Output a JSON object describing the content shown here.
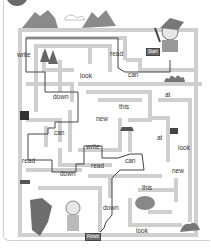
{
  "puzzle": {
    "start_label": "Start",
    "finish_label": "Finish",
    "words": [
      {
        "text": "write",
        "x": 17,
        "y": 52
      },
      {
        "text": "read",
        "x": 110,
        "y": 51
      },
      {
        "text": "look",
        "x": 80,
        "y": 73
      },
      {
        "text": "can",
        "x": 128,
        "y": 72
      },
      {
        "text": "down",
        "x": 53,
        "y": 94
      },
      {
        "text": "at",
        "x": 165,
        "y": 92
      },
      {
        "text": "this",
        "x": 119,
        "y": 104
      },
      {
        "text": "new",
        "x": 96,
        "y": 116
      },
      {
        "text": "at",
        "x": 157,
        "y": 135
      },
      {
        "text": "look",
        "x": 178,
        "y": 145
      },
      {
        "text": "can",
        "x": 54,
        "y": 130
      },
      {
        "text": "write",
        "x": 86,
        "y": 144
      },
      {
        "text": "read",
        "x": 22,
        "y": 158
      },
      {
        "text": "read",
        "x": 91,
        "y": 163
      },
      {
        "text": "can",
        "x": 125,
        "y": 158
      },
      {
        "text": "down",
        "x": 60,
        "y": 171
      },
      {
        "text": "new",
        "x": 172,
        "y": 168
      },
      {
        "text": "this",
        "x": 142,
        "y": 185
      },
      {
        "text": "down",
        "x": 103,
        "y": 205
      },
      {
        "text": "look",
        "x": 136,
        "y": 228
      }
    ]
  }
}
